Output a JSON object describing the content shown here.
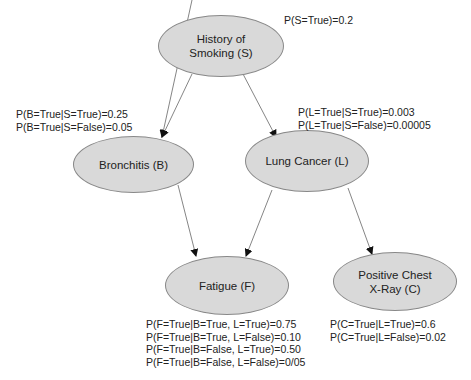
{
  "nodes": {
    "smoking": {
      "label_line1": "History of",
      "label_line2": "Smoking (S)"
    },
    "bronchitis": {
      "label": "Bronchitis (B)"
    },
    "lung_cancer": {
      "label": "Lung Cancer (L)"
    },
    "fatigue": {
      "label": "Fatigue (F)"
    },
    "xray": {
      "label_line1": "Positive Chest",
      "label_line2": "X-Ray (C)"
    }
  },
  "cpts": {
    "smoking": [
      "P(S=True)=0.2"
    ],
    "bronchitis": [
      "P(B=True|S=True)=0.25",
      "P(B=True|S=False)=0.05"
    ],
    "lung_cancer": [
      "P(L=True|S=True)=0.003",
      "P(L=True|S=False)=0.00005"
    ],
    "fatigue": [
      "P(F=True|B=True, L=True)=0.75",
      "P(F=True|B=True, L=False)=0.10",
      "P(F=True|B=False, L=True)=0.50",
      "P(F=True|B=False, L=False)=0/05"
    ],
    "xray": [
      "P(C=True|L=True)=0.6",
      "P(C=True|L=False)=0.02"
    ]
  },
  "edges": [
    {
      "from": "smoking",
      "to": "bronchitis"
    },
    {
      "from": "smoking",
      "to": "lung_cancer"
    },
    {
      "from": "bronchitis",
      "to": "fatigue"
    },
    {
      "from": "lung_cancer",
      "to": "fatigue"
    },
    {
      "from": "lung_cancer",
      "to": "xray"
    }
  ],
  "colors": {
    "node_fill": "#d9d9d9",
    "node_border": "#888888",
    "edge": "#555555"
  }
}
